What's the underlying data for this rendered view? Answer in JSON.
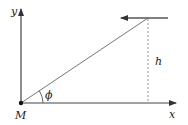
{
  "diagram": {
    "labels": {
      "y_axis": "y",
      "x_axis": "x",
      "origin": "M",
      "angle": "ϕ",
      "height": "h"
    },
    "colors": {
      "line": "#555555",
      "axis": "#444444",
      "dashed": "#888888",
      "text": "#222222"
    }
  }
}
